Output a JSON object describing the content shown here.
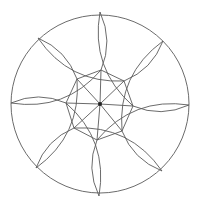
{
  "diagram": {
    "title": "",
    "type": "pinwheel-rosette",
    "center": [
      100,
      104
    ],
    "outer_radius": 89,
    "inner_radius": 35,
    "petal_count": 8,
    "stroke_color": "#5a5a5a",
    "background_color": "#ffffff",
    "outer_points": [
      [
        100,
        12
      ],
      [
        163,
        41
      ],
      [
        189,
        105
      ],
      [
        162,
        171
      ],
      [
        99,
        196
      ],
      [
        36,
        168
      ],
      [
        11,
        103
      ],
      [
        38,
        38
      ]
    ],
    "inner_vertices": [
      [
        101,
        70
      ],
      [
        124,
        81
      ],
      [
        133,
        106
      ],
      [
        122,
        131
      ],
      [
        97,
        140
      ],
      [
        74,
        128
      ],
      [
        66,
        103
      ],
      [
        77,
        79
      ]
    ],
    "center_dot_radius": 2
  }
}
